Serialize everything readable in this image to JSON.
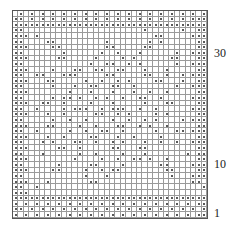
{
  "chart": {
    "columns": 36,
    "rows_count": 37,
    "dot_color": "#222222",
    "grid_color": "#9a9a9a",
    "row_labels": [
      {
        "label": "30",
        "row": 30,
        "top": 46
      },
      {
        "label": "10",
        "row": 10,
        "top": 157
      },
      {
        "label": "1",
        "row": 1,
        "top": 206
      }
    ],
    "rows": [
      ".o.o.o.o.o.o.o.o.o.o.o.o.o.o.o.o.o.o",
      "oo.o.o.o.o.o.o.o.o.o.o.o.o.o.o.o.ooo",
      "oooooooooooooooooooooooooooooooooooo",
      "oo......................o......o..oo",
      "ooo.o.....................oo.....ooo",
      "oo....oo.........o.......o.o......oo",
      "ooo....oo........oo.....oo........oo",
      "oo.......o......o..o...o......o..ooo",
      "ooo.....oo.....o....o.o......oo...oo",
      "oo............o..oo..o.o......o..ooo",
      "ooo....o...oo..oo..oo...o...o.....oo",
      "oo..oo...ooo.....oo.....oo..o..o.ooo",
      "ooo...oo.....o..o..o.o....oo...o..oo",
      "oo.....o...o..oo..oo..o.......o..ooo",
      "ooo.......o...o...o...o..o..o.....oo",
      "oo.....o.oo.o..o.o..o..oo..o.....ooo",
      "ooo..oo..o....o...o.....o...oo....oo",
      "oo..o....o.ooo..o.ooo..o..o......ooo",
      "ooo...o..o.....oo..o.o....o.o.....oo",
      "oo.....o..o..o....o..o..o.o....o.ooo",
      "ooo...oo....o..o...oo..o.o..o.....oo",
      "oo..o.....o..o..oo..o.....o...oo.ooo",
      "ooo...o..o....oo...o..o....o......oo",
      "oo...o.o...oo..o..o.o...o..o..o..ooo",
      "ooo.....oo..o.....oo...oo.........oo",
      "oo...o......o..o....o...o.......o.ooo",
      "ooo........o....o..o..oo.o..o.....oo",
      "oo......o.....oo....o......oo....ooo",
      "ooo....oo....o..o.oo........oo....oo",
      "oo...........o...o...........o...ooo",
      "ooo...o.......oo.................oo",
      "oo..o..............................o",
      "ooo..................................",
      "oooooooooooooooooooooooooooooooooooo",
      "o.o.o.o.o.o.o.o.o.o.o.o.o.o.o.o.o.oo",
      "oo.o.o.o.o.o.o.o.o.o.o.o.o.o.o.o.o.o",
      "o.o.o.o.o.o.o.o.o.o.o.o.o.o.o.o.o.oo"
    ]
  }
}
